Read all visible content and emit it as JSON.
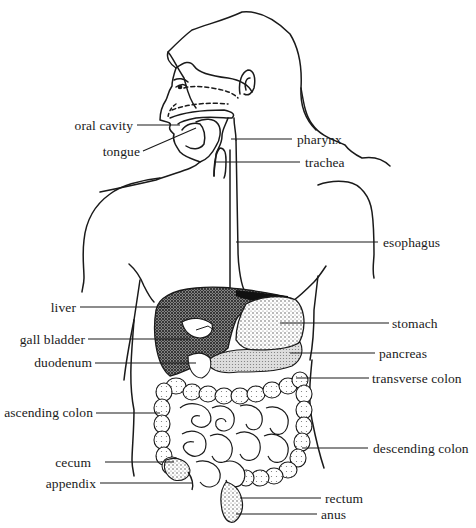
{
  "diagram": {
    "colors": {
      "ink": "#1a1a1a",
      "background": "#ffffff",
      "stipple": "#555555"
    },
    "labels_left": [
      {
        "id": "oral-cavity",
        "text": "oral cavity"
      },
      {
        "id": "tongue",
        "text": "tongue"
      },
      {
        "id": "liver",
        "text": "liver"
      },
      {
        "id": "gall-bladder",
        "text": "gall bladder"
      },
      {
        "id": "duodenum",
        "text": "duodenum"
      },
      {
        "id": "ascending-colon",
        "text": "ascending colon"
      },
      {
        "id": "cecum",
        "text": "cecum"
      },
      {
        "id": "appendix",
        "text": "appendix"
      }
    ],
    "labels_right": [
      {
        "id": "pharynx",
        "text": "pharynx"
      },
      {
        "id": "trachea",
        "text": "trachea"
      },
      {
        "id": "esophagus",
        "text": "esophagus"
      },
      {
        "id": "stomach",
        "text": "stomach"
      },
      {
        "id": "pancreas",
        "text": "pancreas"
      },
      {
        "id": "transverse-colon",
        "text": "transverse colon"
      },
      {
        "id": "descending-colon",
        "text": "descending colon"
      },
      {
        "id": "rectum",
        "text": "rectum"
      },
      {
        "id": "anus",
        "text": "anus"
      }
    ]
  }
}
